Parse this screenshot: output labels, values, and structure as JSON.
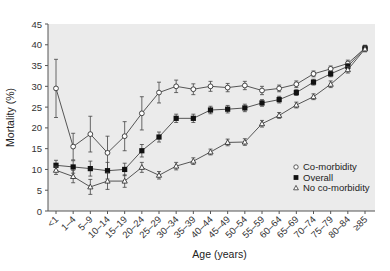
{
  "chart_data": {
    "type": "line",
    "title": "",
    "xlabel": "Age (years)",
    "ylabel": "Mortality (%)",
    "ylim": [
      0,
      45
    ],
    "yticks": [
      0,
      5,
      10,
      15,
      20,
      25,
      30,
      35,
      40,
      45
    ],
    "grid": false,
    "legend_position": "lower right (inside plot)",
    "categories": [
      "<1",
      "1–4",
      "5–9",
      "10–14",
      "15–19",
      "20–24",
      "25–29",
      "30–34",
      "35–39",
      "40–44",
      "45–49",
      "50–54",
      "55–59",
      "60–64",
      "65–69",
      "70–74",
      "75–79",
      "80–84",
      "≥85"
    ],
    "series": [
      {
        "name": "Co-morbidity",
        "marker": "open-circle",
        "values": [
          29.5,
          15.5,
          18.5,
          14.0,
          18.0,
          23.5,
          28.5,
          30.0,
          29.3,
          30.0,
          29.7,
          30.2,
          29.0,
          29.5,
          30.5,
          33.0,
          34.2,
          35.5,
          39.2
        ],
        "error": [
          7.0,
          3.2,
          4.3,
          4.0,
          3.5,
          4.0,
          2.5,
          1.5,
          1.3,
          1.2,
          1.0,
          1.0,
          1.0,
          0.8,
          0.8,
          0.7,
          0.7,
          0.8,
          0.7
        ]
      },
      {
        "name": "Overall",
        "marker": "filled-square",
        "values": [
          11.0,
          10.6,
          10.2,
          9.7,
          10.0,
          14.5,
          17.8,
          22.3,
          22.3,
          24.3,
          24.5,
          24.8,
          26.0,
          26.8,
          28.5,
          31.0,
          33.0,
          34.8,
          39.2
        ],
        "error": [
          1.2,
          1.5,
          1.8,
          2.0,
          1.5,
          1.5,
          1.2,
          1.0,
          1.0,
          0.9,
          0.9,
          0.9,
          0.8,
          0.8,
          0.7,
          0.7,
          0.7,
          0.7,
          0.6
        ]
      },
      {
        "name": "No co-morbidity",
        "marker": "open-triangle",
        "values": [
          9.8,
          8.3,
          5.8,
          7.2,
          7.2,
          10.5,
          8.6,
          10.8,
          12.0,
          14.2,
          16.5,
          16.6,
          21.0,
          23.0,
          25.5,
          27.5,
          30.5,
          34.0,
          39.0
        ],
        "error": [
          1.0,
          1.5,
          1.8,
          2.0,
          1.5,
          1.2,
          0.9,
          0.9,
          0.8,
          0.7,
          0.8,
          0.8,
          0.8,
          0.7,
          0.7,
          0.7,
          0.8,
          0.8,
          0.7
        ]
      }
    ]
  },
  "legend": {
    "items": [
      {
        "label": "Co-morbidity",
        "marker": "open-circle"
      },
      {
        "label": "Overall",
        "marker": "filled-square"
      },
      {
        "label": "No co-morbidity",
        "marker": "open-triangle"
      }
    ]
  },
  "colors": {
    "plot_background": "#ebebeb",
    "line": "#444444",
    "marker_fill_dark": "#111111",
    "marker_fill_open": "#ffffff"
  }
}
